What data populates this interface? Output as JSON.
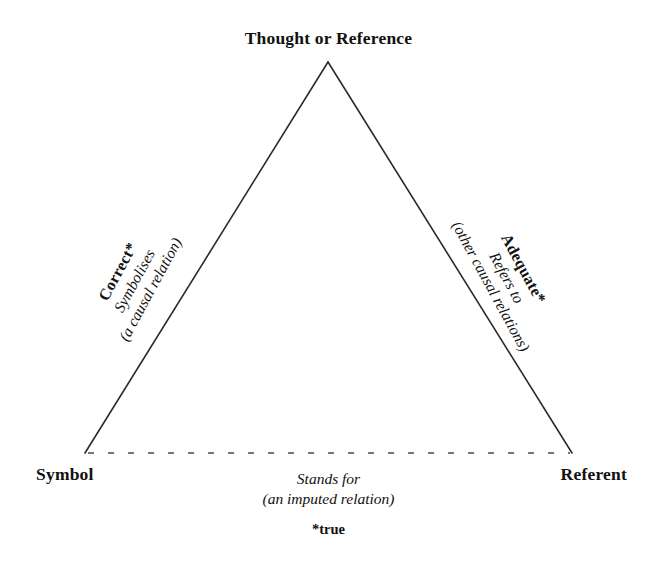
{
  "diagram": {
    "type": "semiotic-triangle",
    "apex": {
      "label": "Thought or Reference"
    },
    "bottom_left": {
      "label": "Symbol"
    },
    "bottom_right": {
      "label": "Referent"
    },
    "left_edge": {
      "heading": "Correct*",
      "relation": "Symbolises",
      "qualifier": "(a causal relation)"
    },
    "right_edge": {
      "heading": "Adequate*",
      "relation": "Refers to",
      "qualifier": "(other causal relations)"
    },
    "baseline": {
      "relation": "Stands for",
      "qualifier": "(an imputed relation)",
      "style": "dashed"
    },
    "footnote": "*true",
    "caption": "",
    "colors": {
      "line": "#2b2b2b",
      "text": "#111111",
      "background": "#ffffff"
    }
  }
}
